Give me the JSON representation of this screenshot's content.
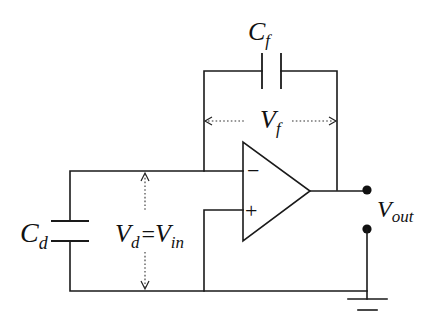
{
  "diagram": {
    "type": "circuit-schematic",
    "colors": {
      "line": "#1a1a1a",
      "background": "#ffffff"
    },
    "labels": {
      "feedback_cap": {
        "main": "C",
        "sub": "f"
      },
      "feedback_voltage": {
        "main": "V",
        "sub": "f"
      },
      "detector_cap": {
        "main": "C",
        "sub": "d"
      },
      "input_voltage": {
        "left_main": "V",
        "left_sub": "d",
        "equals": "=",
        "right_main": "V",
        "right_sub": "in"
      },
      "output": {
        "main": "V",
        "sub": "out"
      },
      "inverting_input": "−",
      "non_inverting_input": "+"
    },
    "components": [
      {
        "id": "Cf",
        "kind": "capacitor",
        "role": "feedback"
      },
      {
        "id": "Cd",
        "kind": "capacitor",
        "role": "detector"
      },
      {
        "id": "U1",
        "kind": "op-amp"
      },
      {
        "id": "GND",
        "kind": "ground"
      },
      {
        "id": "OUT",
        "kind": "output-terminals"
      }
    ]
  }
}
